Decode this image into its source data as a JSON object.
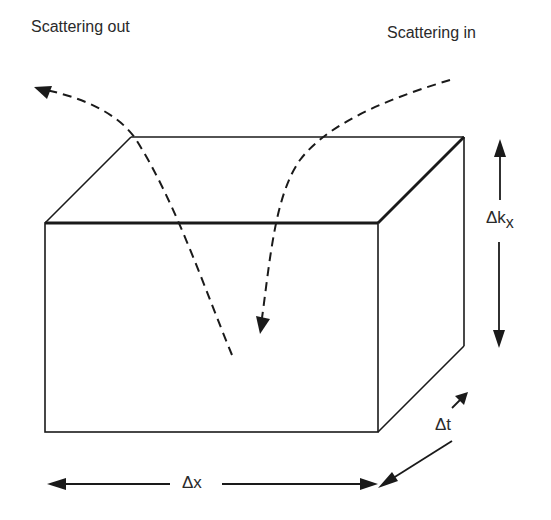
{
  "diagram": {
    "labels": {
      "scattering_out": "Scattering out",
      "scattering_in": "Scattering in",
      "delta_kx_main": "Δk",
      "delta_kx_sub": "x",
      "delta_t": "Δt",
      "delta_x": "Δx"
    },
    "colors": {
      "stroke": "#1a1a1a",
      "text": "#2a2a2a",
      "background": "#ffffff"
    },
    "box": {
      "front_face": {
        "x1": 45,
        "y1": 223,
        "x2": 378,
        "y2": 432
      },
      "depth_offset": {
        "dx": 86,
        "dy": -86
      }
    }
  }
}
